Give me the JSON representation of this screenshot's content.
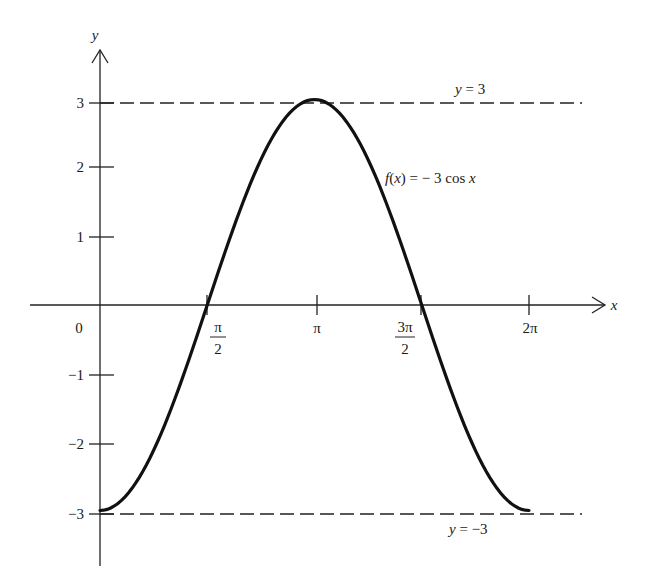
{
  "chart_data": {
    "type": "line",
    "title": "",
    "function_label": "f(x) = − 3 cos x",
    "xlabel": "x",
    "ylabel": "y",
    "x_ticks": [
      {
        "value": 1.5708,
        "label_num": "π",
        "label_den": "2"
      },
      {
        "value": 3.1416,
        "label_num": "π",
        "label_den": ""
      },
      {
        "value": 4.7124,
        "label_num": "3π",
        "label_den": "2"
      },
      {
        "value": 6.2832,
        "label_num": "2π",
        "label_den": ""
      }
    ],
    "origin_label": "0",
    "y_ticks": [
      3,
      2,
      1,
      -1,
      -2,
      -3
    ],
    "y_tick_labels": [
      "3",
      "2",
      "1",
      "−1",
      "−2",
      "−3"
    ],
    "xlim": [
      0,
      6.2832
    ],
    "ylim": [
      -3,
      3
    ],
    "grid": false,
    "series": [
      {
        "name": "f(x) = -3 cos x",
        "x": [
          0,
          0.7854,
          1.5708,
          2.3562,
          3.1416,
          3.927,
          4.7124,
          5.4978,
          6.2832
        ],
        "y": [
          -3,
          -2.12,
          0,
          2.12,
          3,
          2.12,
          0,
          -2.12,
          -3
        ]
      }
    ],
    "reference_lines": [
      {
        "y": 3,
        "label": "y = 3",
        "style": "dashed"
      },
      {
        "y": -3,
        "label": "y = −3",
        "style": "dashed"
      }
    ]
  },
  "labels": {
    "y_axis": "y",
    "x_axis": "x",
    "origin": "0",
    "function": "f(x) = − 3 cos x",
    "upper_asymptote": "y = 3",
    "lower_asymptote": "y = −3",
    "y3": "3",
    "y2": "2",
    "y1": "1",
    "yn1": "−1",
    "yn2": "−2",
    "yn3": "−3",
    "pi_half_num": "π",
    "pi_half_den": "2",
    "pi": "π",
    "three_pi_half_num": "3π",
    "three_pi_half_den": "2",
    "two_pi": "2π"
  }
}
